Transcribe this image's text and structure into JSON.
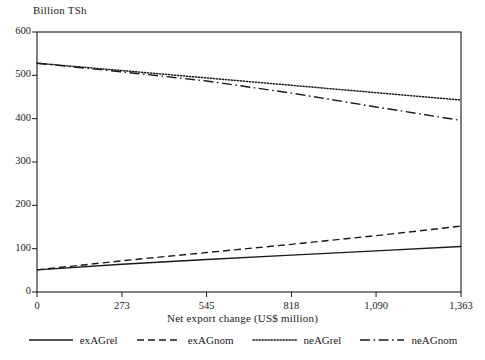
{
  "chart_data": {
    "type": "line",
    "title": "",
    "ylabel": "Billion TSh",
    "xlabel": "Net export change (US$ million)",
    "xlim": [
      0,
      1363
    ],
    "ylim": [
      0,
      600
    ],
    "xticks": [
      0,
      273,
      545,
      818,
      1090,
      1363
    ],
    "xtick_labels": [
      "0",
      "273",
      "545",
      "818",
      "1,090",
      "1,363"
    ],
    "yticks": [
      0,
      100,
      200,
      300,
      400,
      500,
      600
    ],
    "ytick_labels": [
      "0",
      "100",
      "200",
      "300",
      "400",
      "500",
      "600"
    ],
    "grid": false,
    "legend_position": "below",
    "line_color": "#1a1a1a",
    "series": [
      {
        "name": "exAGrel",
        "style": "solid",
        "x": [
          0,
          273,
          545,
          818,
          1090,
          1363
        ],
        "values": [
          51,
          64,
          75,
          85,
          95,
          105
        ]
      },
      {
        "name": "exAGnom",
        "style": "dashed",
        "x": [
          0,
          273,
          545,
          818,
          1090,
          1363
        ],
        "values": [
          51,
          72,
          91,
          110,
          130,
          152
        ]
      },
      {
        "name": "neAGrel",
        "style": "dotted",
        "x": [
          0,
          273,
          545,
          818,
          1090,
          1363
        ],
        "values": [
          528,
          511,
          494,
          477,
          460,
          443
        ]
      },
      {
        "name": "neAGnom",
        "style": "dashdot",
        "x": [
          0,
          273,
          545,
          818,
          1090,
          1363
        ],
        "values": [
          528,
          508,
          487,
          459,
          427,
          396
        ]
      }
    ]
  },
  "legend": {
    "items": [
      {
        "label": "exAGrel",
        "style": "solid"
      },
      {
        "label": "exAGnom",
        "style": "dashed"
      },
      {
        "label": "neAGrel",
        "style": "dotted"
      },
      {
        "label": "neAGnom",
        "style": "dashdot"
      }
    ]
  }
}
